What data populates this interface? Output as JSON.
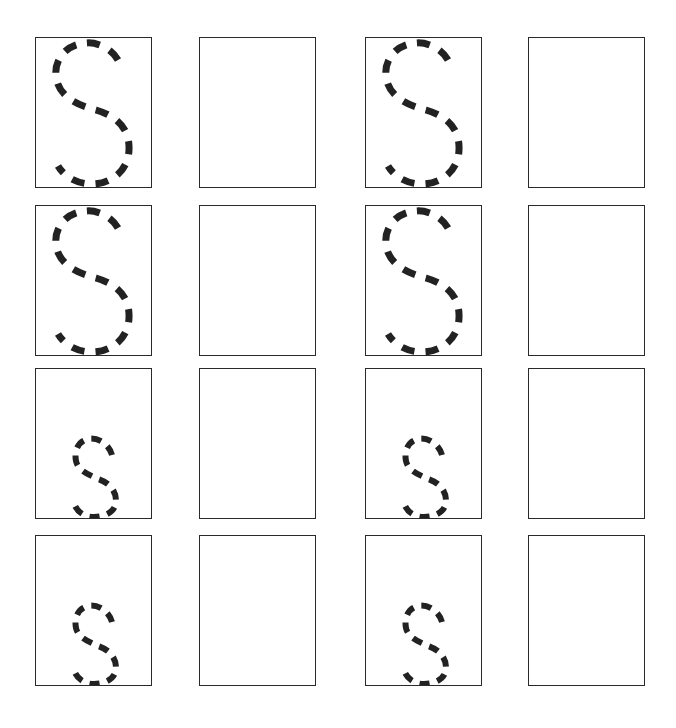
{
  "worksheet": {
    "title": "Letter S tracing practice",
    "letter": "S",
    "stroke_color": "#222222",
    "border_color": "#2a2a2a",
    "columns_left": [
      35,
      199,
      365,
      528
    ],
    "rows_top": [
      37,
      205,
      368,
      535
    ],
    "rows": [
      {
        "cells": [
          {
            "type": "uppercase-trace",
            "glyph": "S"
          },
          {
            "type": "blank"
          },
          {
            "type": "uppercase-trace",
            "glyph": "S"
          },
          {
            "type": "blank"
          }
        ]
      },
      {
        "cells": [
          {
            "type": "uppercase-trace",
            "glyph": "S"
          },
          {
            "type": "blank"
          },
          {
            "type": "uppercase-trace",
            "glyph": "S"
          },
          {
            "type": "blank"
          }
        ]
      },
      {
        "cells": [
          {
            "type": "lowercase-trace",
            "glyph": "s"
          },
          {
            "type": "blank"
          },
          {
            "type": "lowercase-trace",
            "glyph": "s"
          },
          {
            "type": "blank"
          }
        ]
      },
      {
        "cells": [
          {
            "type": "lowercase-trace",
            "glyph": "s"
          },
          {
            "type": "blank"
          },
          {
            "type": "lowercase-trace",
            "glyph": "s"
          },
          {
            "type": "blank"
          }
        ]
      }
    ]
  }
}
